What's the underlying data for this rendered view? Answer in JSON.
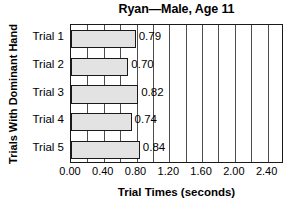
{
  "chart_data": {
    "type": "bar",
    "orientation": "horizontal",
    "title": "Ryan—Male, Age 11",
    "xlabel": "Trial Times (seconds)",
    "ylabel": "Trials With Dominant Hand",
    "categories": [
      "Trial 1",
      "Trial 2",
      "Trial 3",
      "Trial 4",
      "Trial 5"
    ],
    "values": [
      0.79,
      0.7,
      0.82,
      0.74,
      0.84
    ],
    "data_labels": [
      "0.79",
      "0.70",
      "0.82",
      "0.74",
      "0.84"
    ],
    "xlim": [
      0.0,
      2.6
    ],
    "xticks": [
      0.0,
      0.4,
      0.8,
      1.2,
      1.6,
      2.0,
      2.4
    ],
    "xtick_labels": [
      "0.00",
      "0.40",
      "0.80",
      "1.20",
      "1.60",
      "2.00",
      "2.40"
    ],
    "gridlines": [
      0.2,
      0.4,
      0.6,
      0.8,
      1.0,
      1.2,
      1.4,
      1.6,
      1.8,
      2.0,
      2.2,
      2.4
    ],
    "grid": true,
    "legend": null,
    "colors": {
      "bar_fill": "#e3e3e3",
      "bar_edge": "#1a1a1a",
      "grid": "#4d4d4d",
      "axis": "#1a1a1a",
      "text": "#000000",
      "background": "#ffffff"
    }
  }
}
